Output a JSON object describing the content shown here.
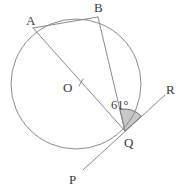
{
  "figure": {
    "background_color": "#ffffff",
    "stroke_color": "#8a8a8a",
    "label_color": "#3a3a3a",
    "sector_fill_color": "#c8c8c8",
    "sector_stroke_color": "#707070"
  },
  "labels": {
    "point_a": "A",
    "point_b": "B",
    "point_o": "O",
    "point_q": "Q",
    "point_p": "P",
    "point_r": "R",
    "angle_value": "61",
    "angle_degree_symbol": "°",
    "angle_text": "61°"
  },
  "geometry": {
    "circle": {
      "cx": 76,
      "cy": 84,
      "r": 65
    },
    "points": {
      "A": {
        "x": 33,
        "y": 28
      },
      "B": {
        "x": 98,
        "y": 17
      },
      "O": {
        "x": 76,
        "y": 84
      },
      "Q": {
        "x": 125,
        "y": 131
      },
      "P": {
        "x": 83,
        "y": 170
      },
      "R": {
        "x": 165,
        "y": 95
      }
    },
    "label_positions": {
      "A": {
        "x": 26,
        "y": 25
      },
      "B": {
        "x": 94,
        "y": 12
      },
      "O": {
        "x": 63,
        "y": 92
      },
      "Q": {
        "x": 124,
        "y": 147
      },
      "P": {
        "x": 69,
        "y": 184
      },
      "R": {
        "x": 166,
        "y": 94
      },
      "angle": {
        "x": 111,
        "y": 109
      }
    },
    "segments": [
      {
        "name": "chord-ab",
        "from": "A",
        "to": "B"
      },
      {
        "name": "chord-bq",
        "from": "B",
        "to": "Q"
      },
      {
        "name": "diameter-aq",
        "from": "A",
        "to": "Q"
      },
      {
        "name": "tangent-pr",
        "from": "P",
        "to": "R"
      }
    ],
    "angle_marker": {
      "vertex": "Q",
      "between": [
        "chord-bq",
        "ray-qr"
      ],
      "radius": 22,
      "value_degrees": 61
    },
    "center_tick": {
      "x1": 79,
      "y1": 86,
      "x2": 83,
      "y2": 79
    }
  }
}
